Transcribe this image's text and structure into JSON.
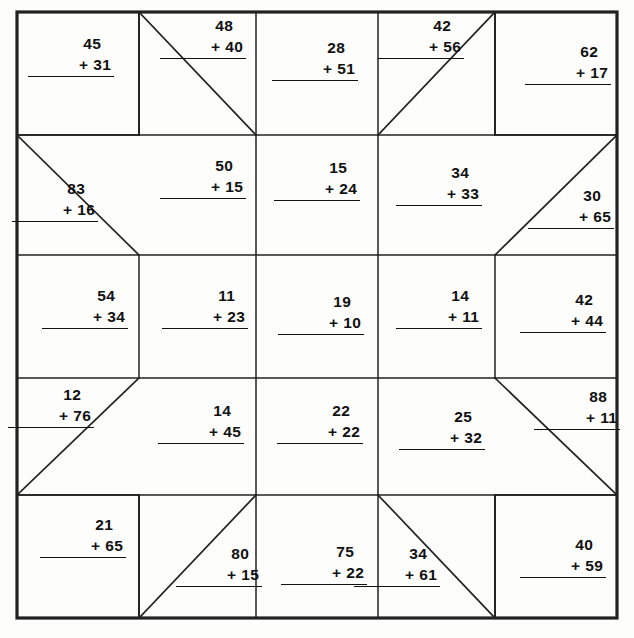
{
  "worksheet": {
    "title": "Addition Quilt Worksheet",
    "grid": {
      "rows": 5,
      "cols": 5,
      "cell_size": 120.5,
      "origin_x": 17,
      "origin_y": 12
    },
    "colors": {
      "ink": "#111111",
      "paper": "#fdfdfc",
      "line": "#222222"
    }
  },
  "problems": [
    {
      "id": "p1",
      "row": 0,
      "col": 0,
      "top": "45",
      "op": "+",
      "bottom": "31",
      "x": 28,
      "y": 36
    },
    {
      "id": "p2",
      "row": 0,
      "col": 1,
      "top": "48",
      "op": "+",
      "bottom": "40",
      "x": 160,
      "y": 18
    },
    {
      "id": "p3",
      "row": 0,
      "col": 2,
      "top": "28",
      "op": "+",
      "bottom": "51",
      "x": 272,
      "y": 40
    },
    {
      "id": "p4",
      "row": 0,
      "col": 3,
      "top": "42",
      "op": "+",
      "bottom": "56",
      "x": 378,
      "y": 18
    },
    {
      "id": "p5",
      "row": 0,
      "col": 4,
      "top": "62",
      "op": "+",
      "bottom": "17",
      "x": 525,
      "y": 44
    },
    {
      "id": "p6",
      "row": 1,
      "col": 0,
      "top": "83",
      "op": "+",
      "bottom": "16",
      "x": 12,
      "y": 181
    },
    {
      "id": "p7",
      "row": 1,
      "col": 1,
      "top": "50",
      "op": "+",
      "bottom": "15",
      "x": 160,
      "y": 158
    },
    {
      "id": "p8",
      "row": 1,
      "col": 2,
      "top": "15",
      "op": "+",
      "bottom": "24",
      "x": 274,
      "y": 160
    },
    {
      "id": "p9",
      "row": 1,
      "col": 3,
      "top": "34",
      "op": "+",
      "bottom": "33",
      "x": 396,
      "y": 165
    },
    {
      "id": "p10",
      "row": 1,
      "col": 4,
      "top": "30",
      "op": "+",
      "bottom": "65",
      "x": 528,
      "y": 188
    },
    {
      "id": "p11",
      "row": 2,
      "col": 0,
      "top": "54",
      "op": "+",
      "bottom": "34",
      "x": 42,
      "y": 288
    },
    {
      "id": "p12",
      "row": 2,
      "col": 1,
      "top": "11",
      "op": "+",
      "bottom": "23",
      "x": 162,
      "y": 288
    },
    {
      "id": "p13",
      "row": 2,
      "col": 2,
      "top": "19",
      "op": "+",
      "bottom": "10",
      "x": 278,
      "y": 294
    },
    {
      "id": "p14",
      "row": 2,
      "col": 3,
      "top": "14",
      "op": "+",
      "bottom": "11",
      "x": 396,
      "y": 288
    },
    {
      "id": "p15",
      "row": 2,
      "col": 4,
      "top": "42",
      "op": "+",
      "bottom": "44",
      "x": 520,
      "y": 292
    },
    {
      "id": "p16",
      "row": 3,
      "col": 0,
      "top": "12",
      "op": "+",
      "bottom": "76",
      "x": 8,
      "y": 387
    },
    {
      "id": "p17",
      "row": 3,
      "col": 1,
      "top": "14",
      "op": "+",
      "bottom": "45",
      "x": 158,
      "y": 403
    },
    {
      "id": "p18",
      "row": 3,
      "col": 2,
      "top": "22",
      "op": "+",
      "bottom": "22",
      "x": 277,
      "y": 403
    },
    {
      "id": "p19",
      "row": 3,
      "col": 3,
      "top": "25",
      "op": "+",
      "bottom": "32",
      "x": 399,
      "y": 409
    },
    {
      "id": "p20",
      "row": 3,
      "col": 4,
      "top": "88",
      "op": "+",
      "bottom": "11",
      "x": 534,
      "y": 389
    },
    {
      "id": "p21",
      "row": 4,
      "col": 0,
      "top": "21",
      "op": "+",
      "bottom": "65",
      "x": 40,
      "y": 517
    },
    {
      "id": "p22",
      "row": 4,
      "col": 1,
      "top": "80",
      "op": "+",
      "bottom": "15",
      "x": 176,
      "y": 546
    },
    {
      "id": "p23",
      "row": 4,
      "col": 2,
      "top": "75",
      "op": "+",
      "bottom": "22",
      "x": 281,
      "y": 544
    },
    {
      "id": "p24",
      "row": 4,
      "col": 3,
      "top": "34",
      "op": "+",
      "bottom": "61",
      "x": 354,
      "y": 546
    },
    {
      "id": "p25",
      "row": 4,
      "col": 4,
      "top": "40",
      "op": "+",
      "bottom": "59",
      "x": 520,
      "y": 537
    }
  ],
  "lines": {
    "outer_border": {
      "x": 17,
      "y": 12,
      "width": 600,
      "height": 606
    },
    "corner_squares": [
      {
        "name": "top-left-square",
        "x": 17,
        "y": 12,
        "w": 122,
        "h": 123
      },
      {
        "name": "top-right-square",
        "x": 495,
        "y": 12,
        "w": 122,
        "h": 123
      },
      {
        "name": "bottom-left-square",
        "x": 17,
        "y": 495,
        "w": 122,
        "h": 123
      },
      {
        "name": "bottom-right-square",
        "x": 495,
        "y": 495,
        "w": 122,
        "h": 123
      }
    ],
    "diagonals": [
      {
        "name": "d-top-col1",
        "x1": 139,
        "y1": 12,
        "x2": 256,
        "y2": 135
      },
      {
        "name": "d-top-col3",
        "x1": 378,
        "y1": 135,
        "x2": 495,
        "y2": 12
      },
      {
        "name": "d-left-row1",
        "x1": 17,
        "y1": 135,
        "x2": 139,
        "y2": 255
      },
      {
        "name": "d-right-row1",
        "x1": 495,
        "y1": 255,
        "x2": 617,
        "y2": 135
      },
      {
        "name": "d-left-row3",
        "x1": 17,
        "y1": 495,
        "x2": 139,
        "y2": 378
      },
      {
        "name": "d-right-row3",
        "x1": 495,
        "y1": 378,
        "x2": 617,
        "y2": 495
      },
      {
        "name": "d-bottom-col1",
        "x1": 139,
        "y1": 618,
        "x2": 256,
        "y2": 495
      },
      {
        "name": "d-bottom-col3",
        "x1": 378,
        "y1": 495,
        "x2": 495,
        "y2": 618
      }
    ]
  }
}
